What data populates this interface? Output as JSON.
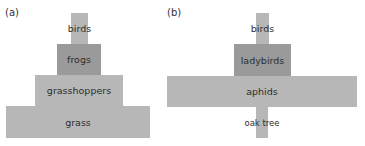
{
  "panels": [
    {
      "label": "(a)",
      "title": "pyramid of numbers",
      "levels": [
        {
          "name": "birds",
          "shade": "light"
        },
        {
          "name": "frogs",
          "shade": "dark"
        },
        {
          "name": "grasshoppers",
          "shade": "light"
        },
        {
          "name": "grass",
          "shade": "light"
        }
      ]
    },
    {
      "label": "(b)",
      "levels": [
        {
          "name": "birds",
          "shade": "light"
        },
        {
          "name": "ladybirds",
          "shade": "dark"
        },
        {
          "name": "aphids",
          "shade": "light"
        },
        {
          "name": "oak tree",
          "shade": "light"
        }
      ]
    }
  ],
  "colors": {
    "light_bar": "#b7b7b7",
    "dark_bar": "#9a9a9a",
    "text": "#2e2e2e"
  }
}
